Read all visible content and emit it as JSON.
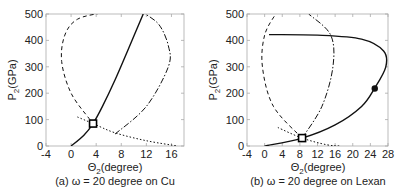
{
  "chart_data": [
    {
      "type": "line",
      "panel": "a",
      "caption": "(a) ω = 20 degree on Cu",
      "xlabel": "Θ2(degree)",
      "ylabel": "P2(GPa)",
      "xlim": [
        -4,
        18
      ],
      "ylim": [
        0,
        500
      ],
      "xticks": [
        -4,
        0,
        4,
        8,
        12,
        16
      ],
      "yticks": [
        0,
        100,
        200,
        300,
        400,
        500
      ],
      "series": [
        {
          "name": "solid",
          "style": "solid",
          "x": [
            0,
            2,
            3.5,
            5,
            7,
            9,
            11.5
          ],
          "y": [
            0,
            40,
            85,
            150,
            250,
            360,
            500
          ]
        },
        {
          "name": "dashed",
          "style": "dashed",
          "x": [
            3,
            0,
            -1.5,
            -1,
            1,
            5,
            8
          ],
          "y": [
            100,
            200,
            320,
            420,
            480,
            505,
            520
          ]
        },
        {
          "name": "dash-dot",
          "style": "dash-dot",
          "x": [
            7,
            12,
            15.5,
            15.5,
            14,
            11.5
          ],
          "y": [
            45,
            150,
            300,
            380,
            460,
            505
          ]
        },
        {
          "name": "dotted",
          "style": "dotted",
          "x": [
            1,
            3.5,
            7,
            12,
            17
          ],
          "y": [
            110,
            85,
            50,
            20,
            0
          ]
        }
      ],
      "markers": [
        {
          "shape": "square",
          "x": 3.5,
          "y": 85
        }
      ]
    },
    {
      "type": "line",
      "panel": "b",
      "caption": "(b) ω = 20 degree on Lexan",
      "xlabel": "Θ2(degree)",
      "ylabel": "P2(GPa)",
      "xlim": [
        -4,
        28
      ],
      "ylim": [
        0,
        500
      ],
      "xticks": [
        -4,
        0,
        4,
        8,
        12,
        16,
        20,
        24,
        28
      ],
      "yticks": [
        0,
        100,
        200,
        300,
        400,
        500
      ],
      "series": [
        {
          "name": "solid",
          "style": "solid",
          "x": [
            0,
            8.5,
            16,
            22,
            25,
            27.5,
            27,
            22,
            12,
            1
          ],
          "y": [
            0,
            30,
            80,
            150,
            220,
            300,
            360,
            405,
            420,
            422
          ]
        },
        {
          "name": "dashed",
          "style": "dashed",
          "x": [
            8.5,
            2,
            -0.5,
            0,
            2.5
          ],
          "y": [
            30,
            150,
            300,
            420,
            500
          ]
        },
        {
          "name": "dash-dot",
          "style": "dash-dot",
          "x": [
            8.5,
            13,
            15.5,
            15,
            10
          ],
          "y": [
            30,
            150,
            300,
            420,
            500
          ]
        },
        {
          "name": "dotted",
          "style": "dotted",
          "x": [
            3,
            8.5,
            14,
            17
          ],
          "y": [
            70,
            30,
            5,
            0
          ]
        }
      ],
      "markers": [
        {
          "shape": "square",
          "x": 8.5,
          "y": 30
        },
        {
          "shape": "circle",
          "x": 25,
          "y": 218
        }
      ]
    }
  ]
}
